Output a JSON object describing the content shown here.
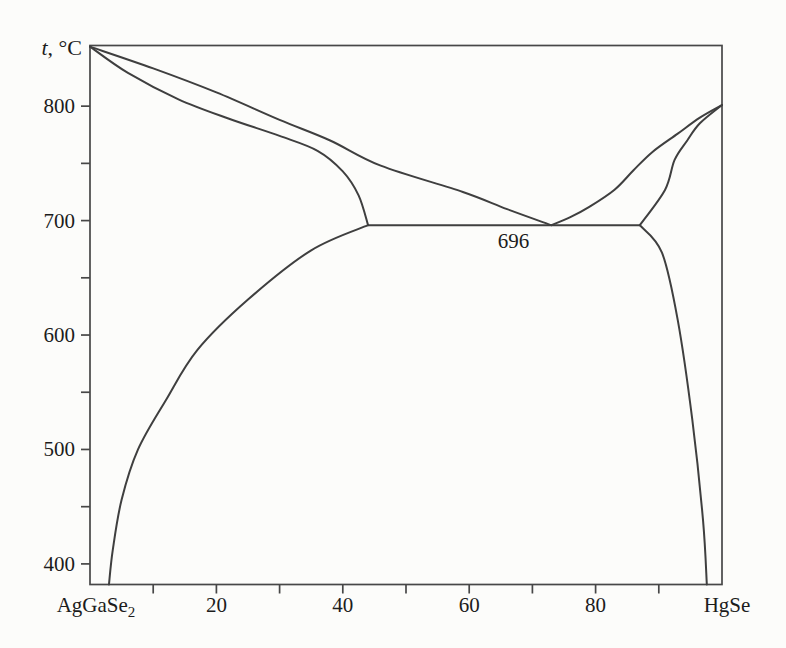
{
  "figure": {
    "background_color": "#fcfcfa",
    "line_color": "#3f3f3f",
    "frame_color": "#474747",
    "text_color": "#1c1c1c"
  },
  "chart_data": {
    "type": "line",
    "title": "",
    "x_axis": {
      "range": [
        0,
        100
      ],
      "left_end_label": {
        "base": "AgGaSe",
        "sub": "2"
      },
      "right_end_label": "HgSe",
      "labeled_ticks": [
        20,
        40,
        60,
        80
      ],
      "minor_ticks": [
        10,
        30,
        50,
        70,
        90
      ],
      "grid": false
    },
    "y_axis": {
      "label": {
        "italic": "t",
        "rest": ", °C"
      },
      "range": [
        382,
        853
      ],
      "labeled_ticks": [
        400,
        500,
        600,
        700,
        800
      ],
      "minor_ticks": [
        450,
        550,
        650,
        750
      ],
      "grid": false
    },
    "annotations": [
      {
        "text": "696",
        "x": 67,
        "t": 676
      }
    ],
    "points_of_interest": {
      "melting_point_left_C": 852,
      "melting_point_right_C": 801,
      "eutectic_temperature_C": 696,
      "eutectic_composition_mol_pct": 73,
      "eutectic_line_span_mol_pct": [
        44,
        87
      ]
    },
    "series": [
      {
        "name": "liquidus-left",
        "smooth": true,
        "points": [
          [
            0,
            852
          ],
          [
            10,
            833
          ],
          [
            20,
            812
          ],
          [
            30,
            788
          ],
          [
            38,
            770
          ],
          [
            46,
            748
          ],
          [
            59,
            725
          ],
          [
            66,
            710
          ],
          [
            73,
            696
          ]
        ]
      },
      {
        "name": "solidus-left",
        "smooth": true,
        "points": [
          [
            0,
            852
          ],
          [
            6,
            829
          ],
          [
            14,
            806
          ],
          [
            22,
            789
          ],
          [
            30,
            774
          ],
          [
            36,
            761
          ],
          [
            40,
            743
          ],
          [
            42.5,
            722
          ],
          [
            44,
            696
          ]
        ]
      },
      {
        "name": "liquidus-right",
        "smooth": true,
        "points": [
          [
            73,
            696
          ],
          [
            76,
            703
          ],
          [
            79,
            712
          ],
          [
            83,
            727
          ],
          [
            86,
            744
          ],
          [
            89,
            760
          ],
          [
            93,
            776
          ],
          [
            96.5,
            790
          ],
          [
            100,
            801
          ]
        ]
      },
      {
        "name": "solidus-right",
        "smooth": true,
        "points": [
          [
            87,
            696
          ],
          [
            91,
            727
          ],
          [
            92.5,
            753
          ],
          [
            94.5,
            770
          ],
          [
            96.5,
            785
          ],
          [
            100,
            801
          ]
        ]
      },
      {
        "name": "eutectic-tie-line",
        "smooth": false,
        "points": [
          [
            44,
            696
          ],
          [
            87,
            696
          ]
        ]
      },
      {
        "name": "solvus-left",
        "smooth": true,
        "points": [
          [
            44,
            696
          ],
          [
            35,
            674
          ],
          [
            25,
            631
          ],
          [
            17,
            587
          ],
          [
            12,
            543
          ],
          [
            7.6,
            500
          ],
          [
            5,
            456
          ],
          [
            3.6,
            412
          ],
          [
            3,
            382
          ]
        ]
      },
      {
        "name": "solvus-right",
        "smooth": true,
        "points": [
          [
            87,
            696
          ],
          [
            90.5,
            672
          ],
          [
            93,
            613
          ],
          [
            95.3,
            526
          ],
          [
            97,
            438
          ],
          [
            97.6,
            382
          ]
        ]
      }
    ]
  }
}
